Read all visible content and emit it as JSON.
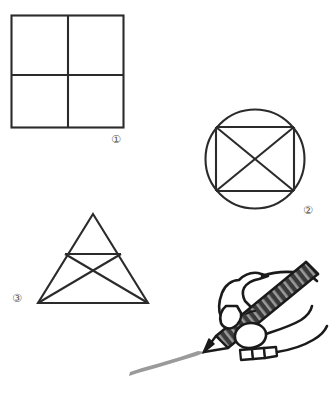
{
  "page": {
    "background_color": "#ffffff",
    "width": 333,
    "height": 408
  },
  "style": {
    "stroke_color": "#2b2b2b",
    "label_color": "#555555",
    "pencil_body_dark": "#3a3a3a",
    "pencil_body_light": "#8c8c8c",
    "pencil_tip_color": "#1a1a1a",
    "drawn_stroke_color": "#999999",
    "hand_outline_color": "#1a1a1a",
    "hand_fill_color": "#ffffff"
  },
  "figures": [
    {
      "id": "figure-1",
      "label": "①",
      "label_text": "1",
      "name": "square-divided-in-four",
      "shape": "square",
      "description": "Square divided into four quadrants by one vertical and one horizontal line",
      "bounds": {
        "x": 11,
        "y": 15,
        "width": 113,
        "height": 113
      },
      "divider_x": 68,
      "divider_y": 75,
      "label_position": {
        "x": 111,
        "y": 134
      }
    },
    {
      "id": "figure-2",
      "label": "②",
      "label_text": "2",
      "name": "circle-with-inscribed-rectangle-and-diagonals",
      "shape": "circle",
      "description": "Circle containing an inscribed rectangle with both diagonals drawn forming an X",
      "circle": {
        "cx": 255,
        "cy": 159,
        "r": 50
      },
      "rectangle": {
        "x1": 216,
        "y1": 127,
        "x2": 294,
        "y2": 191
      },
      "label_position": {
        "x": 303,
        "y": 205
      }
    },
    {
      "id": "figure-3",
      "label": "③",
      "label_text": "3",
      "name": "triangle-with-midline-and-crossing-lines",
      "shape": "triangle",
      "description": "Triangle with a horizontal midsegment and two lines from the base corners crossing to the opposite midsegment endpoints",
      "apex": {
        "x": 93,
        "y": 214
      },
      "base_left": {
        "x": 38,
        "y": 303
      },
      "base_right": {
        "x": 148,
        "y": 303
      },
      "midline_left": {
        "x": 65,
        "y": 254
      },
      "midline_right": {
        "x": 121,
        "y": 254
      },
      "label_position": {
        "x": 12,
        "y": 293
      }
    }
  ],
  "illustration": {
    "id": "hand-with-pencil",
    "name": "hand-holding-pencil",
    "description": "Line-art illustration of a right hand gripping a hatched pencil that is drawing a tapering gray stroke toward the lower left",
    "pencil": {
      "tip": {
        "x": 205,
        "y": 355
      },
      "end": {
        "x": 316,
        "y": 268
      },
      "hatched": true
    },
    "drawn_stroke": {
      "from": {
        "x": 205,
        "y": 353
      },
      "to": {
        "x": 130,
        "y": 375
      },
      "color": "#999999"
    }
  }
}
